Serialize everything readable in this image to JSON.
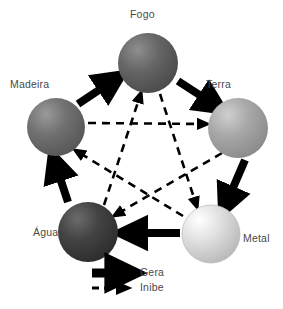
{
  "diagram": {
    "background_color": "#ffffff",
    "nodes": [
      {
        "id": "fogo",
        "label": "Fogo",
        "cx": 148,
        "cy": 63,
        "r": 30,
        "fill": "#5e5e5e",
        "highlight": "#8e8e8e",
        "label_x": 130,
        "label_y": 14
      },
      {
        "id": "madeira",
        "label": "Madeira",
        "cx": 56,
        "cy": 127,
        "r": 29,
        "fill": "#6a6a6a",
        "highlight": "#9a9a9a",
        "label_x": 10,
        "label_y": 83
      },
      {
        "id": "terra",
        "label": "Terra",
        "cx": 238,
        "cy": 128,
        "r": 30,
        "fill": "#a0a0a0",
        "highlight": "#cfcfcf",
        "label_x": 206,
        "label_y": 83
      },
      {
        "id": "metal",
        "label": "Metal",
        "cx": 211,
        "cy": 234,
        "r": 29,
        "fill": "#d8d8d8",
        "highlight": "#ffffff",
        "label_x": 243,
        "label_y": 238
      },
      {
        "id": "agua",
        "label": "Água",
        "cx": 88,
        "cy": 232,
        "r": 30,
        "fill": "#3c3c3c",
        "highlight": "#6b6b6b",
        "label_x": 35,
        "label_y": 232
      }
    ],
    "generating_cycle": {
      "relation": "Gera",
      "style": "solid-thick-arrow",
      "color": "#000000",
      "edges": [
        {
          "from": "madeira",
          "to": "fogo"
        },
        {
          "from": "fogo",
          "to": "terra"
        },
        {
          "from": "terra",
          "to": "metal"
        },
        {
          "from": "metal",
          "to": "agua"
        },
        {
          "from": "agua",
          "to": "madeira"
        }
      ]
    },
    "inhibiting_cycle": {
      "relation": "Inibe",
      "style": "dashed-arrow",
      "color": "#000000",
      "edges": [
        {
          "from": "madeira",
          "to": "terra"
        },
        {
          "from": "terra",
          "to": "agua"
        },
        {
          "from": "agua",
          "to": "fogo"
        },
        {
          "from": "fogo",
          "to": "metal"
        },
        {
          "from": "metal",
          "to": "madeira"
        }
      ]
    },
    "legend": {
      "items": [
        {
          "id": "gera",
          "label": "Gera",
          "style": "solid-thick-arrow"
        },
        {
          "id": "inibe",
          "label": "Inibe",
          "style": "dashed-arrow"
        }
      ],
      "solid_label_x": 140,
      "solid_label_y": 273,
      "dashed_label_x": 140,
      "dashed_label_y": 288
    }
  }
}
